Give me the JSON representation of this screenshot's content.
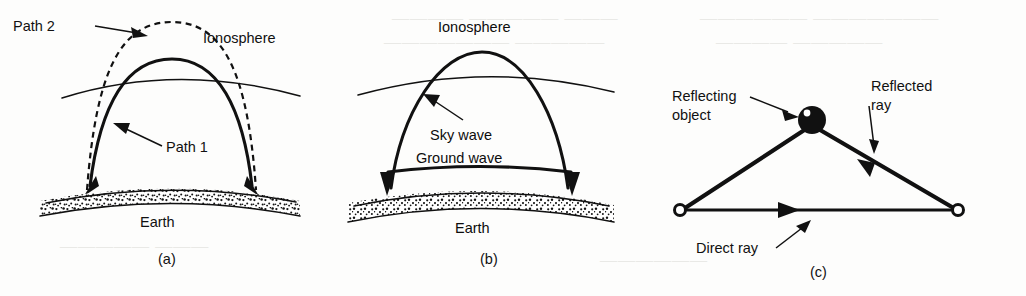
{
  "figure": {
    "type": "technical-line-diagram",
    "background_color": "#fdfdfc",
    "ink_color": "#111111"
  },
  "panels": [
    {
      "id": "a",
      "caption": "(a)",
      "labels": {
        "path2": "Path 2",
        "ionosphere": "Ionosphere",
        "path1": "Path 1",
        "earth": "Earth"
      },
      "elements": [
        "dashed-arc-path2",
        "solid-arc-path1",
        "ionosphere-curve",
        "earth-surface",
        "arrowhead-left",
        "arrowhead-right"
      ]
    },
    {
      "id": "b",
      "caption": "(b)",
      "labels": {
        "ionosphere": "Ionosphere",
        "sky_wave": "Sky wave",
        "ground_wave": "Ground wave",
        "earth": "Earth"
      },
      "elements": [
        "sky-wave-arc",
        "ionosphere-curve",
        "ground-wave-curve",
        "earth-surface",
        "arrowhead-left",
        "arrowhead-right"
      ]
    },
    {
      "id": "c",
      "caption": "(c)",
      "labels": {
        "reflecting_object": "Reflecting\nobject",
        "reflecting_object_line1": "Reflecting",
        "reflecting_object_line2": "object",
        "reflected_ray_line1": "Reflected",
        "reflected_ray_line2": "ray",
        "direct_ray": "Direct ray"
      },
      "elements": [
        "transmitter-node",
        "receiver-node",
        "reflecting-sphere",
        "incident-ray",
        "reflected-ray",
        "direct-ray",
        "direct-ray-arrowhead",
        "reflected-ray-arrowhead"
      ]
    }
  ],
  "ghost_text": [
    {
      "text": "————  ————— ———",
      "x": 392,
      "y": 8
    },
    {
      "text": "——————— —————",
      "x": 384,
      "y": 32
    },
    {
      "text": "—————— ———————",
      "x": 700,
      "y": 8
    },
    {
      "text": "———— —————",
      "x": 716,
      "y": 32
    },
    {
      "text": "————— ———",
      "x": 60,
      "y": 236
    },
    {
      "text": "——————",
      "x": 600,
      "y": 250
    }
  ]
}
